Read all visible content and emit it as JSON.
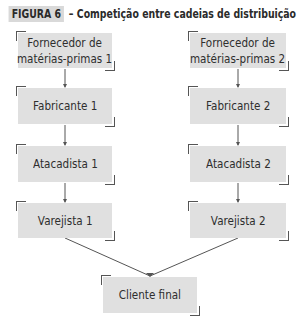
{
  "figure": {
    "label": "FIGURA 6",
    "caption": "– Competição entre cadeias de distribuição"
  },
  "chains": [
    {
      "name": "Cadeia 1",
      "nodes": [
        {
          "line1": "Fornecedor de",
          "line2": "matérias-primas 1"
        },
        {
          "line1": "Fabricante 1"
        },
        {
          "line1": "Atacadista 1"
        },
        {
          "line1": "Varejista 1"
        }
      ]
    },
    {
      "name": "Cadeia 2",
      "nodes": [
        {
          "line1": "Fornecedor de",
          "line2": "matérias-primas 2"
        },
        {
          "line1": "Fabricante 2"
        },
        {
          "line1": "Atacadista 2"
        },
        {
          "line1": "Varejista 2"
        }
      ]
    }
  ],
  "final_node": {
    "line1": "Cliente final"
  },
  "colors": {
    "box_fill": "#e0e0e0",
    "bracket": "#555555",
    "text": "#2e2e2e",
    "connector": "#555555"
  }
}
